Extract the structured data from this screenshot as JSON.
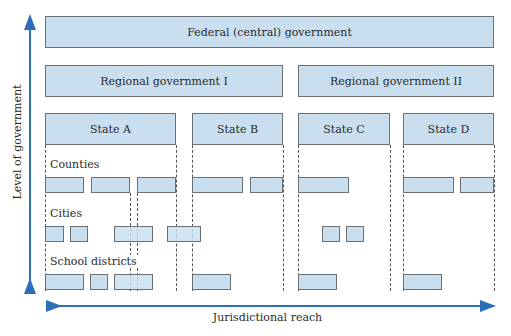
{
  "levels": {
    "federal": "Federal (central) government",
    "regional": [
      "Regional government I",
      "Regional government II"
    ],
    "states": [
      "State A",
      "State B",
      "State C",
      "State D"
    ]
  },
  "row_labels": {
    "counties": "Counties",
    "cities": "Cities",
    "school_districts": "School districts"
  },
  "axes": {
    "vertical": "Level of government",
    "horizontal": "Jurisdictional reach"
  },
  "colors": {
    "box_fill": "#c9dff0",
    "box_border": "#6b7075",
    "arrow": "#2a6fb8"
  }
}
